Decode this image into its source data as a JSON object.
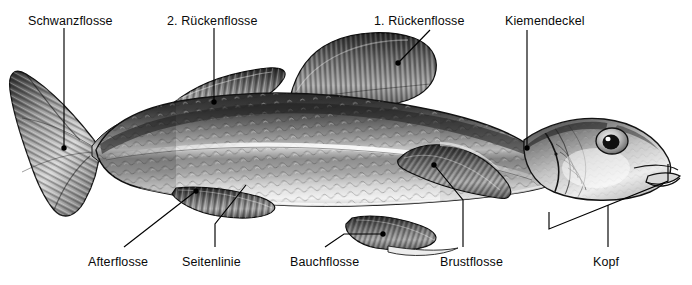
{
  "figure": {
    "language": "de",
    "background_color": "#ffffff",
    "line_color": "#000000",
    "text_color": "#0a0a0a"
  },
  "labels": [
    {
      "id": "schwanzflosse",
      "text": "Schwanzflosse",
      "x": 28,
      "y": 14
    },
    {
      "id": "rueckenflosse2",
      "text": "2. Rückenflosse",
      "x": 167,
      "y": 14
    },
    {
      "id": "rueckenflosse1",
      "text": "1. Rückenflosse",
      "x": 374,
      "y": 14
    },
    {
      "id": "kiemendeckel",
      "text": "Kiemendeckel",
      "x": 505,
      "y": 14
    },
    {
      "id": "afterflosse",
      "text": "Afterflosse",
      "x": 88,
      "y": 255
    },
    {
      "id": "seitenlinie",
      "text": "Seitenlinie",
      "x": 182,
      "y": 255
    },
    {
      "id": "bauchflosse",
      "text": "Bauchflosse",
      "x": 290,
      "y": 255
    },
    {
      "id": "brustflosse",
      "text": "Brustflosse",
      "x": 440,
      "y": 255
    },
    {
      "id": "kopf",
      "text": "Kopf",
      "x": 593,
      "y": 255
    }
  ]
}
